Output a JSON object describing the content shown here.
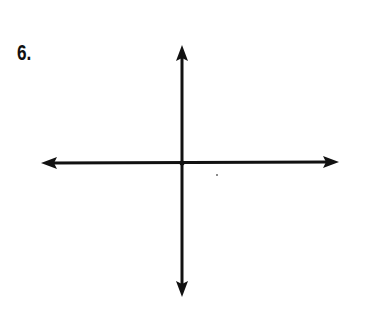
{
  "problem": {
    "number_label": "6."
  },
  "axes": {
    "origin": [
      182,
      163
    ],
    "x_axis": {
      "left_tip": [
        41,
        163
      ],
      "right_tip": [
        339,
        162
      ]
    },
    "y_axis": {
      "top_tip": [
        182,
        45
      ],
      "bottom_tip": [
        182,
        297
      ]
    },
    "stroke_color": "#111111",
    "stroke_width": 3
  },
  "marks": [
    {
      "type": "dot",
      "position": [
        217,
        175
      ]
    }
  ]
}
